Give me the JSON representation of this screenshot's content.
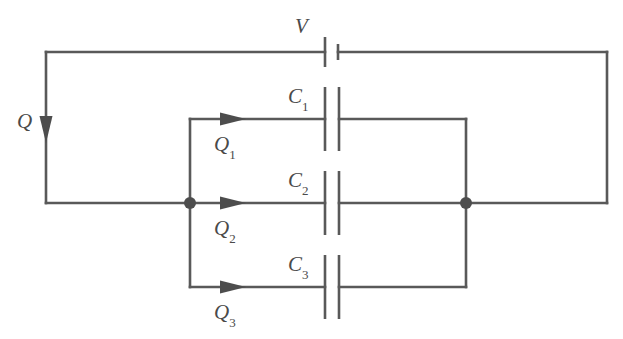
{
  "figure": {
    "kind": "circuit-diagram",
    "background_color": "#ffffff",
    "line_color": "#595959",
    "label_color": "#4a4a4a"
  },
  "labels": {
    "source_voltage": "V",
    "total_charge": "Q",
    "capacitor_1": "C",
    "capacitor_1_sub": "1",
    "capacitor_2": "C",
    "capacitor_2_sub": "2",
    "capacitor_3": "C",
    "capacitor_3_sub": "3",
    "charge_1": "Q",
    "charge_1_sub": "1",
    "charge_2": "Q",
    "charge_2_sub": "2",
    "charge_3": "Q",
    "charge_3_sub": "3"
  },
  "geometry": {
    "outer_loop": {
      "left_x": 46,
      "right_x": 607,
      "top_y": 52,
      "mid_y": 203
    },
    "battery": {
      "long_plate_x": 325,
      "short_plate_x": 338,
      "long_plate_half_height": 15,
      "short_plate_half_height": 8
    },
    "branch": {
      "left_x": 190,
      "right_x": 466,
      "rows_y": [
        119,
        203,
        287
      ],
      "plate_left_x": 325,
      "plate_right_x": 339,
      "plate_half_height": 32
    },
    "arrow_x": {
      "q_total": 46,
      "q_branch": 232
    },
    "nodes": [
      {
        "x": 190,
        "y": 203
      },
      {
        "x": 466,
        "y": 203
      }
    ]
  }
}
